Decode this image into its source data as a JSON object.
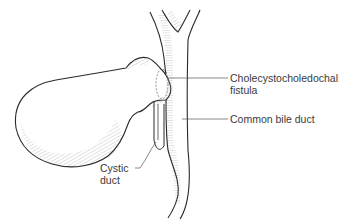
{
  "diagram": {
    "type": "anatomical-illustration",
    "structures": [
      "gallbladder",
      "common-bile-duct",
      "cystic-duct",
      "fistula"
    ],
    "colors": {
      "outline": "#2a2a2a",
      "hatching": "#9a9a9a",
      "leader": "#555555",
      "text": "#3a3a3a",
      "background": "#ffffff"
    }
  },
  "labels": {
    "fistula": {
      "line1": "Cholecystocholedochal",
      "line2": "fistula"
    },
    "common_bile_duct": {
      "line1": "Common bile duct"
    },
    "cystic_duct": {
      "line1": "Cystic",
      "line2": "duct"
    }
  }
}
